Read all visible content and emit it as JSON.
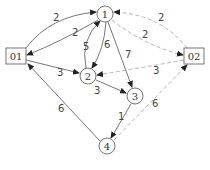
{
  "diagram": {
    "type": "directed-network",
    "colors": {
      "solid_edge": "#555555",
      "dashed_edge": "#aaaaaa",
      "node_stroke": "#555555",
      "arrow": "#222222"
    },
    "nodes": [
      {
        "id": "1",
        "label": "1",
        "shape": "circle",
        "x": 105,
        "y": 14
      },
      {
        "id": "2",
        "label": "2",
        "shape": "circle",
        "x": 88,
        "y": 76
      },
      {
        "id": "3",
        "label": "3",
        "shape": "circle",
        "x": 135,
        "y": 96
      },
      {
        "id": "4",
        "label": "4",
        "shape": "circle",
        "x": 107,
        "y": 146
      },
      {
        "id": "01",
        "label": "01",
        "shape": "box",
        "x": 16,
        "y": 56
      },
      {
        "id": "02",
        "label": "02",
        "shape": "box",
        "x": 194,
        "y": 56
      }
    ],
    "edges": [
      {
        "from": "01",
        "to": "1",
        "label": "2",
        "style": "solid"
      },
      {
        "from": "1",
        "to": "01",
        "label": "2",
        "style": "solid"
      },
      {
        "from": "01",
        "to": "2",
        "label": "3",
        "style": "solid"
      },
      {
        "from": "2",
        "to": "1",
        "label": "5",
        "style": "solid"
      },
      {
        "from": "1",
        "to": "2",
        "label": "6",
        "style": "solid"
      },
      {
        "from": "1",
        "to": "3",
        "label": "7",
        "style": "solid"
      },
      {
        "from": "2",
        "to": "3",
        "label": "3",
        "style": "solid"
      },
      {
        "from": "3",
        "to": "4",
        "label": "1",
        "style": "solid"
      },
      {
        "from": "4",
        "to": "01",
        "label": "6",
        "style": "solid"
      },
      {
        "from": "02",
        "to": "1",
        "label": "2",
        "style": "dashed"
      },
      {
        "from": "1",
        "to": "02",
        "label": "2",
        "style": "dashed"
      },
      {
        "from": "02",
        "to": "2",
        "label": "3",
        "style": "dashed"
      },
      {
        "from": "4",
        "to": "02",
        "label": "6",
        "style": "dashed"
      }
    ]
  }
}
